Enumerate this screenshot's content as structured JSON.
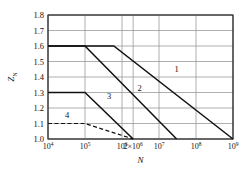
{
  "chart_data": {
    "type": "line",
    "title": "",
    "xlabel": "N",
    "ylabel": "Z_N",
    "xscale": "log",
    "xlim": [
      10000,
      1000000000
    ],
    "ylim": [
      1.0,
      1.8
    ],
    "grid": true,
    "legend": "inline-curve-labels",
    "xticks": [
      10000,
      100000,
      1000000,
      2000000,
      10000000,
      100000000,
      1000000000
    ],
    "xticklabels": [
      "10⁴",
      "10⁵",
      "10⁶",
      "2×10⁶",
      "10⁷",
      "10⁸",
      "10⁹"
    ],
    "yticks": [
      1.0,
      1.1,
      1.2,
      1.3,
      1.4,
      1.5,
      1.6,
      1.7,
      1.8
    ],
    "yticklabels": [
      "1.0",
      "1.1",
      "1.2",
      "1.3",
      "1.4",
      "1.5",
      "1.6",
      "1.7",
      "1.8"
    ],
    "series": [
      {
        "name": "1",
        "label": "1",
        "style": "solid",
        "label_x": 30000000,
        "label_y": 1.43,
        "points": [
          {
            "x": 10000,
            "y": 1.6
          },
          {
            "x": 600000,
            "y": 1.6
          },
          {
            "x": 1000000000,
            "y": 1.0
          }
        ]
      },
      {
        "name": "2",
        "label": "2",
        "style": "solid",
        "label_x": 3000000,
        "label_y": 1.31,
        "points": [
          {
            "x": 10000,
            "y": 1.6
          },
          {
            "x": 100000,
            "y": 1.6
          },
          {
            "x": 30000000,
            "y": 1.0
          }
        ]
      },
      {
        "name": "3",
        "label": "3",
        "style": "solid",
        "label_x": 450000,
        "label_y": 1.255,
        "points": [
          {
            "x": 10000,
            "y": 1.3
          },
          {
            "x": 100000,
            "y": 1.3
          },
          {
            "x": 2000000,
            "y": 1.0
          }
        ]
      },
      {
        "name": "4",
        "label": "4",
        "style": "dashed",
        "label_x": 33000,
        "label_y": 1.135,
        "points": [
          {
            "x": 10000,
            "y": 1.1
          },
          {
            "x": 100000,
            "y": 1.1
          },
          {
            "x": 2000000,
            "y": 1.0
          }
        ]
      }
    ]
  },
  "axes": {
    "y_axis_title": "Z",
    "y_axis_subscript": "N",
    "x_axis_title": "N"
  }
}
